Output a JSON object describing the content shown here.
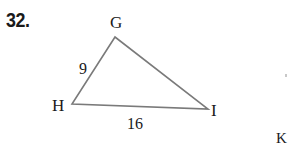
{
  "problem": {
    "number": "32."
  },
  "figure": {
    "type": "triangle",
    "vertices": {
      "G": {
        "label": "G"
      },
      "H": {
        "label": "H"
      },
      "I": {
        "label": "I"
      }
    },
    "sides": {
      "GH": {
        "label": "9"
      },
      "HI": {
        "label": "16"
      }
    },
    "stroke_color": "#7a7a7a"
  },
  "cropped_neighbor": {
    "label": "K"
  }
}
